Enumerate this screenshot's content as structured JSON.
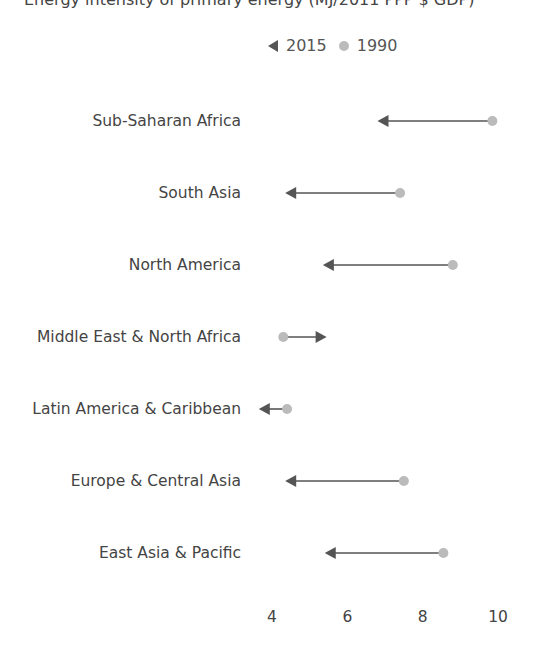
{
  "chart_data": {
    "type": "dumbbell-arrow",
    "title": "Energy intensity of primary energy (MJ/2011 PPP $ GDP)",
    "legend": [
      {
        "name": "2015",
        "marker": "triangle-arrow",
        "color": "#555555"
      },
      {
        "name": "1990",
        "marker": "circle",
        "color": "#bbbbbb"
      }
    ],
    "categories": [
      "Sub-Saharan Africa",
      "South Asia",
      "North America",
      "Middle East & North Africa",
      "Latin America & Caribbean",
      "Europe & Central Asia",
      "East Asia & Pacific"
    ],
    "series": [
      {
        "name": "1990",
        "values": [
          9.85,
          7.4,
          8.8,
          4.3,
          4.4,
          7.5,
          8.55
        ]
      },
      {
        "name": "2015",
        "values": [
          6.8,
          4.35,
          5.35,
          5.45,
          3.65,
          4.35,
          5.4
        ]
      }
    ],
    "xticks": [
      4,
      6,
      8,
      10
    ],
    "xlim": [
      3.5,
      10.5
    ],
    "xlabel": "",
    "ylabel": "",
    "grid": false
  },
  "legend_labels": {
    "y2015": "2015",
    "y1990": "1990"
  },
  "colors": {
    "arrow": "#555555",
    "dot": "#bbbbbb",
    "text": "#444444"
  }
}
